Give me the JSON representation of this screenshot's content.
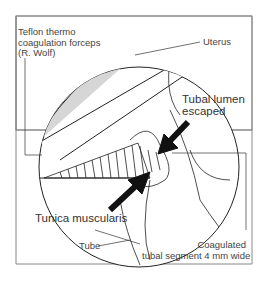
{
  "figure": {
    "labels": {
      "forceps": [
        "Teflon thermo",
        "coagulation forceps",
        "(R. Wolf)"
      ],
      "uterus": "Uterus",
      "lumen": [
        "Tubal lumen",
        "escaped"
      ],
      "tunica": "Tunica muscularis",
      "tube": "Tube",
      "segment": [
        "Coagulated",
        "tubal segment 4 mm wide"
      ]
    },
    "colors": {
      "line": "#222222",
      "fill_gray": "#d9d9d9",
      "frame": "#777777"
    }
  }
}
